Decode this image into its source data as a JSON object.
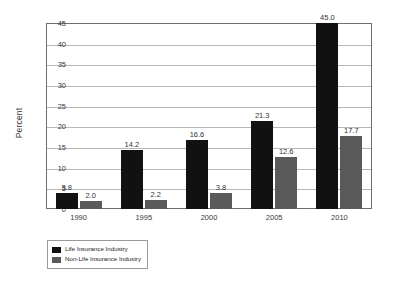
{
  "chart_data": {
    "type": "bar",
    "title": "",
    "subtitle": "",
    "xlabel": "",
    "ylabel": "Percent",
    "ylim": [
      0,
      45
    ],
    "ytick_step": 5,
    "yticks": [
      "45",
      "40",
      "35",
      "30",
      "25",
      "20",
      "15",
      "10",
      "5",
      "0"
    ],
    "grid": true,
    "grid_axis": "y",
    "legend_position": "below-left",
    "categories": [
      "1990",
      "1995",
      "2000",
      "2005",
      "2010"
    ],
    "series": [
      {
        "name": "Life Insurance Industry",
        "color": "#111111",
        "values": [
          3.8,
          14.2,
          16.6,
          21.3,
          45.0
        ],
        "labels": [
          "3.8",
          "14.2",
          "16.6",
          "21.3",
          "45.0"
        ]
      },
      {
        "name": "Non-Life Insurance Industry",
        "color": "#5a5a5a",
        "values": [
          2.0,
          2.2,
          3.8,
          12.6,
          17.7
        ],
        "labels": [
          "2.0",
          "2.2",
          "3.8",
          "12.6",
          "17.7"
        ]
      }
    ]
  },
  "legend": {
    "items": [
      {
        "label": "Life Insurance Industry",
        "color": "#111111"
      },
      {
        "label": "Non-Life Insurance Industry",
        "color": "#5a5a5a"
      }
    ]
  },
  "colors": {
    "life": "#111111",
    "nonlife": "#5a5a5a",
    "gridline": "#b8b8b8",
    "frame": "#6e6e6e",
    "text": "#3a3a3a",
    "background": "#ffffff"
  }
}
